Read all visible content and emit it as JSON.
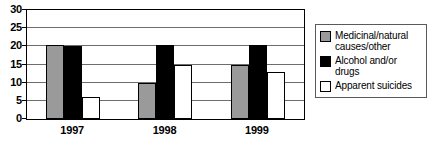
{
  "chart_data": {
    "type": "bar",
    "title": "",
    "subtitle": "",
    "xlabel": "",
    "ylabel": "",
    "categories": [
      "1997",
      "1998",
      "1999"
    ],
    "series": [
      {
        "name": "Medicinal/natural causes/other",
        "legend_label": "Medicinal/natural\ncauses/other",
        "color": "#9a9a9a",
        "values": [
          20.5,
          10,
          15
        ]
      },
      {
        "name": "Alcohol and/or drugs",
        "legend_label": "Alcohol and/or\ndrugs",
        "color": "#000000",
        "values": [
          20,
          20.5,
          20.5
        ]
      },
      {
        "name": "Apparent suicides",
        "legend_label": "Apparent suicides",
        "color": "#ffffff",
        "values": [
          6,
          15,
          13
        ]
      }
    ],
    "ylim": [
      0,
      30
    ],
    "yticks": [
      0,
      5,
      10,
      15,
      20,
      25,
      30
    ],
    "ytick_labels": [
      "0",
      "5",
      "10",
      "15",
      "20",
      "25",
      "30"
    ],
    "grid": true,
    "grid_axis": "y",
    "legend_position": "right",
    "axis_color": "#000000",
    "gridline_color": "#6d6d6d",
    "background_color": "#ffffff"
  }
}
